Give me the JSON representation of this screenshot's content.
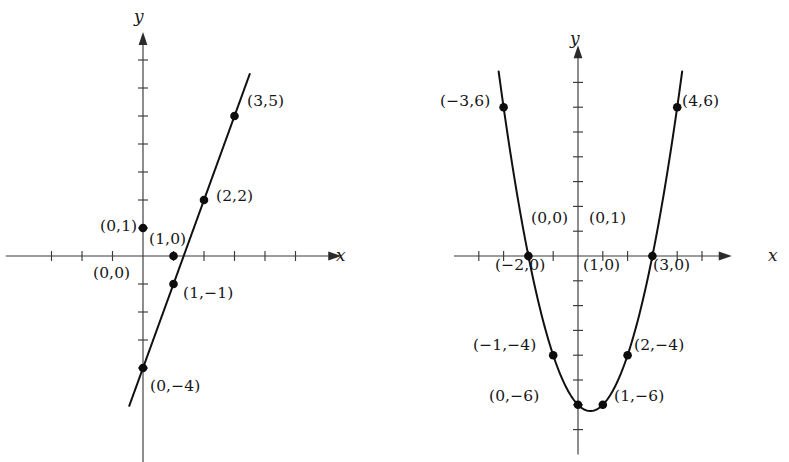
{
  "figure": {
    "background_color": "#ffffff",
    "ink_color": "#111111",
    "axis_color": "#3a3a3a"
  },
  "panels": [
    {
      "id": "left",
      "name": "line-graph",
      "axis_x_label": "x",
      "axis_y_label": "y",
      "point_labels": [
        {
          "text": "(3,5)",
          "x": 247,
          "y": 94
        },
        {
          "text": "(2,2)",
          "x": 216,
          "y": 189
        },
        {
          "text": "(0,1)",
          "x": 100,
          "y": 219
        },
        {
          "text": "(1,0)",
          "x": 149,
          "y": 232
        },
        {
          "text": "(0,0)",
          "x": 93,
          "y": 266
        },
        {
          "text": "(1,−1)",
          "x": 183,
          "y": 286
        },
        {
          "text": "(0,−4)",
          "x": 150,
          "y": 379
        }
      ]
    },
    {
      "id": "right",
      "name": "parabola-graph",
      "axis_x_label": "x",
      "axis_y_label": "y",
      "point_labels": [
        {
          "text": "(−3,6)",
          "x": 440,
          "y": 94
        },
        {
          "text": "(4,6)",
          "x": 682,
          "y": 94
        },
        {
          "text": "(0,0)",
          "x": 531,
          "y": 211
        },
        {
          "text": "(0,1)",
          "x": 589,
          "y": 211
        },
        {
          "text": "(−2,0)",
          "x": 495,
          "y": 258
        },
        {
          "text": "(1,0)",
          "x": 583,
          "y": 258
        },
        {
          "text": "(3,0)",
          "x": 653,
          "y": 258
        },
        {
          "text": "(−1,−4)",
          "x": 473,
          "y": 338
        },
        {
          "text": "(2,−4)",
          "x": 634,
          "y": 338
        },
        {
          "text": "(0,−6)",
          "x": 489,
          "y": 389
        },
        {
          "text": "(1,−6)",
          "x": 614,
          "y": 389
        }
      ]
    }
  ],
  "chart_data": [
    {
      "type": "line",
      "title": "",
      "xlabel": "x",
      "ylabel": "y",
      "equation": "y = 3x - 4",
      "grid": false,
      "legend": "none",
      "xlim": [
        -4.5,
        6.5
      ],
      "ylim": [
        -7.5,
        8.0
      ],
      "origin_px": [
        143,
        256
      ],
      "unit_px": [
        30.5,
        28.0
      ],
      "x": [
        0,
        1,
        2,
        3
      ],
      "values": [
        -4,
        -1,
        2,
        5
      ],
      "points": [
        {
          "label": "(0,−4)",
          "x": 0,
          "y": -4
        },
        {
          "label": "(1,−1)",
          "x": 1,
          "y": -1
        },
        {
          "label": "(2,2)",
          "x": 2,
          "y": 2
        },
        {
          "label": "(3,5)",
          "x": 3,
          "y": 5
        }
      ],
      "reference_points": [
        {
          "label": "(0,1)",
          "x": 0,
          "y": 1
        },
        {
          "label": "(1,0)",
          "x": 1,
          "y": 0
        },
        {
          "label": "(0,0)",
          "x": 0,
          "y": 0
        }
      ],
      "x_ticks": [
        -3,
        -2,
        -1,
        1,
        2,
        3,
        4,
        5
      ],
      "y_ticks": [
        -4,
        -3,
        -2,
        -1,
        1,
        2,
        3,
        4,
        5,
        6,
        7
      ],
      "line_domain": [
        -0.45,
        3.5
      ]
    },
    {
      "type": "line",
      "title": "",
      "xlabel": "x",
      "ylabel": "y",
      "equation": "y = x^2 - x - 6",
      "grid": false,
      "legend": "none",
      "xlim": [
        -5.0,
        6.2
      ],
      "ylim": [
        -8.0,
        8.5
      ],
      "origin_px": [
        578,
        256
      ],
      "unit_px": [
        24.8,
        24.8
      ],
      "x": [
        -3,
        -2,
        -1,
        0,
        1,
        2,
        3,
        4
      ],
      "values": [
        6,
        0,
        -4,
        -6,
        -6,
        -4,
        0,
        6
      ],
      "points": [
        {
          "label": "(−3,6)",
          "x": -3,
          "y": 6
        },
        {
          "label": "(−2,0)",
          "x": -2,
          "y": 0
        },
        {
          "label": "(−1,−4)",
          "x": -1,
          "y": -4
        },
        {
          "label": "(0,−6)",
          "x": 0,
          "y": -6
        },
        {
          "label": "(1,−6)",
          "x": 1,
          "y": -6
        },
        {
          "label": "(2,−4)",
          "x": 2,
          "y": -4
        },
        {
          "label": "(3,0)",
          "x": 3,
          "y": 0
        },
        {
          "label": "(4,6)",
          "x": 4,
          "y": 6
        }
      ],
      "reference_points": [
        {
          "label": "(0,0)",
          "x": 0,
          "y": 0
        },
        {
          "label": "(0,1)",
          "x": 0,
          "y": 0
        },
        {
          "label": "(1,0)",
          "x": 1,
          "y": 0
        }
      ],
      "x_ticks": [
        -4,
        -3,
        -2,
        -1,
        1,
        2,
        3,
        4,
        5
      ],
      "y_ticks": [
        -7,
        -6,
        -5,
        -4,
        -3,
        -2,
        -1,
        1,
        2,
        3,
        4,
        5,
        6,
        7
      ],
      "curve_domain": [
        -3.2,
        4.2
      ]
    }
  ]
}
